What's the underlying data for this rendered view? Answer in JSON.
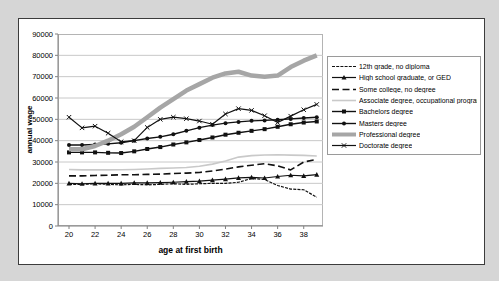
{
  "page": {
    "background": "#d6d6d6",
    "frame_bg": "#ffffff"
  },
  "axes": {
    "y_title": "annual wage",
    "x_title": "age at first birth",
    "y_ticks": [
      0,
      10000,
      20000,
      30000,
      40000,
      50000,
      60000,
      70000,
      80000,
      90000
    ],
    "x_ticks": [
      20,
      22,
      24,
      26,
      28,
      30,
      32,
      34,
      36,
      38
    ]
  },
  "colors": {
    "black_series": "#111111",
    "professional_gray": "#a6a6a6",
    "associate_light_gray": "#c9c9c9",
    "gridline": "#c8c8c8",
    "axis_line": "#808080",
    "plot_border": "#b4b4b4"
  },
  "chart_data": {
    "type": "line",
    "title": "",
    "xlabel": "age at first birth",
    "ylabel": "annual wage",
    "x": [
      20,
      21,
      22,
      23,
      24,
      25,
      26,
      27,
      28,
      29,
      30,
      31,
      32,
      33,
      34,
      35,
      36,
      37,
      38,
      39
    ],
    "xlim": [
      19.2,
      40
    ],
    "ylim": [
      0,
      90000
    ],
    "grid": true,
    "legend_position": "right",
    "series": [
      {
        "name": "12th grade, no diploma",
        "color": "#111111",
        "line_width": 1.2,
        "dash": "3,1.2",
        "marker": "none",
        "values": [
          19500,
          19500,
          19800,
          19500,
          19300,
          19500,
          19300,
          19500,
          19800,
          19500,
          19800,
          20000,
          20000,
          20500,
          22300,
          21800,
          19000,
          17300,
          17000,
          13500
        ]
      },
      {
        "name": "High school graduate, or GED",
        "color": "#111111",
        "line_width": 1.2,
        "dash": "",
        "marker": "triangle",
        "values": [
          20000,
          19800,
          20000,
          20000,
          20000,
          20200,
          20200,
          20300,
          20500,
          20800,
          21000,
          21500,
          22000,
          22600,
          22800,
          22500,
          23200,
          23800,
          23500,
          24100
        ]
      },
      {
        "name": "Some college, no degree",
        "color": "#111111",
        "line_width": 1.6,
        "dash": "7,3.5",
        "marker": "none",
        "values": [
          23500,
          23500,
          23700,
          23800,
          24000,
          24000,
          24200,
          24300,
          24600,
          24800,
          25100,
          25800,
          26700,
          27700,
          28500,
          29200,
          28200,
          26300,
          30000,
          31200
        ]
      },
      {
        "name": "Associate degree, occupational program",
        "color": "#c9c9c9",
        "line_width": 1.6,
        "dash": "",
        "marker": "none",
        "values": [
          26500,
          26300,
          26300,
          26300,
          26400,
          26500,
          26700,
          27000,
          27200,
          27400,
          28000,
          29000,
          30500,
          32300,
          33000,
          33300,
          33400,
          33200,
          33100,
          32800
        ]
      },
      {
        "name": "Bachelors degree",
        "color": "#111111",
        "line_width": 1.4,
        "dash": "",
        "marker": "square",
        "values": [
          34500,
          34500,
          34500,
          34300,
          34200,
          35000,
          36100,
          37000,
          38200,
          39200,
          40300,
          41500,
          42800,
          43700,
          44600,
          45400,
          46500,
          47700,
          48500,
          49000
        ]
      },
      {
        "name": "Masters degree",
        "color": "#111111",
        "line_width": 1.4,
        "dash": "",
        "marker": "circle",
        "values": [
          38000,
          38000,
          38200,
          38500,
          39000,
          40000,
          41000,
          41800,
          43000,
          44600,
          46100,
          47300,
          48200,
          48800,
          49300,
          49500,
          49800,
          50200,
          50600,
          51000
        ]
      },
      {
        "name": "Professional degree",
        "color": "#a6a6a6",
        "line_width": 4.5,
        "dash": "",
        "marker": "none",
        "values": [
          36000,
          36000,
          37500,
          40000,
          43000,
          46500,
          51000,
          55500,
          59500,
          63500,
          66500,
          69500,
          71500,
          72300,
          70500,
          70000,
          70500,
          74500,
          77500,
          80000
        ]
      },
      {
        "name": "Doctorate degree",
        "color": "#111111",
        "line_width": 1.2,
        "dash": "",
        "marker": "x",
        "values": [
          51000,
          46000,
          46800,
          43500,
          39500,
          40000,
          46200,
          50000,
          51000,
          50300,
          49200,
          47700,
          52500,
          55000,
          54200,
          51700,
          48500,
          51500,
          54500,
          57000
        ]
      }
    ]
  }
}
